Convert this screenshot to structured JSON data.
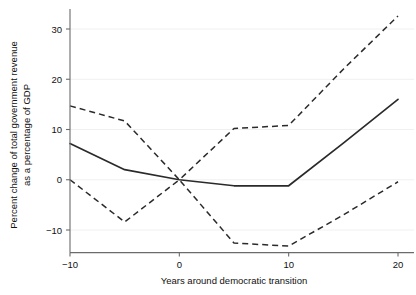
{
  "chart_data": {
    "type": "line",
    "title": "",
    "xlabel": "Years around democratic transition",
    "ylabel": "Percent change of total government revenue\nas a percentage of GDP",
    "ylabel_line1": "Percent change of total government revenue",
    "ylabel_line2": "as a percentage of GDP",
    "x": [
      -10,
      -5,
      0,
      5,
      10,
      15,
      20
    ],
    "xlim": [
      -10,
      20
    ],
    "ylim": [
      -14.5,
      34
    ],
    "xticks": [
      -10,
      0,
      10,
      20
    ],
    "xtick_labels": [
      "−10",
      "0",
      "10",
      "20"
    ],
    "yticks": [
      -10,
      0,
      10,
      20,
      30
    ],
    "ytick_labels": [
      "−10",
      "0",
      "10",
      "20",
      "30"
    ],
    "grid": "horizontal-light",
    "legend": "none",
    "series": [
      {
        "name": "Point estimate",
        "style": "solid",
        "values": [
          7.2,
          2.0,
          0.0,
          -1.2,
          -1.2,
          7.3,
          16.0
        ]
      },
      {
        "name": "Upper confidence bound",
        "style": "dashed",
        "values": [
          14.7,
          11.7,
          0.0,
          10.2,
          10.8,
          22.0,
          32.6
        ]
      },
      {
        "name": "Lower confidence bound",
        "style": "dashed",
        "values": [
          0.0,
          -8.4,
          0.0,
          -12.6,
          -13.2,
          -7.0,
          -0.4
        ]
      }
    ]
  }
}
